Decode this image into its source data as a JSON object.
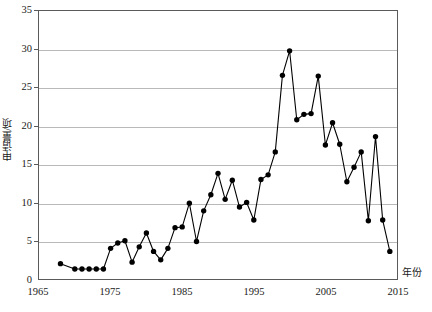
{
  "chart_data": {
    "type": "line",
    "title": "",
    "subtitle": "",
    "xlabel": "年份",
    "ylabel": "申请量/项",
    "xlim": [
      1965,
      2015
    ],
    "ylim": [
      0,
      35
    ],
    "grid": true,
    "legend": null,
    "marker": "filled-circle",
    "line_color": "#000000",
    "marker_color": "#000000",
    "grid_color": "#b9b9b9",
    "axis_color": "#5a5a5a",
    "xticks": [
      1965,
      1975,
      1985,
      1995,
      2005,
      2015
    ],
    "xtick_labels": [
      "1965",
      "1975",
      "1985",
      "1995",
      "2005",
      "2015"
    ],
    "yticks": [
      0,
      5,
      10,
      15,
      20,
      25,
      30,
      35
    ],
    "ytick_labels": [
      "0",
      "5",
      "10",
      "15",
      "20",
      "25",
      "30",
      "35"
    ],
    "series": [
      {
        "name": "申请量",
        "x": [
          1968,
          1970,
          1971,
          1972,
          1973,
          1974,
          1975,
          1976,
          1977,
          1978,
          1979,
          1980,
          1981,
          1982,
          1983,
          1984,
          1985,
          1986,
          1987,
          1988,
          1989,
          1990,
          1991,
          1992,
          1993,
          1994,
          1995,
          1996,
          1997,
          1998,
          1999,
          2000,
          2001,
          2002,
          2003,
          2004,
          2005,
          2006,
          2007,
          2008,
          2009,
          2010,
          2011,
          2012,
          2013,
          2014
        ],
        "values": [
          2.0,
          1.3,
          1.3,
          1.3,
          1.3,
          1.3,
          4.0,
          4.7,
          5.0,
          2.2,
          4.2,
          6.0,
          3.6,
          2.5,
          4.0,
          6.7,
          6.8,
          9.9,
          4.9,
          8.9,
          11.0,
          13.8,
          10.4,
          12.9,
          9.4,
          10.0,
          7.7,
          13.0,
          13.6,
          16.6,
          26.6,
          29.8,
          20.8,
          21.5,
          21.6,
          26.5,
          17.5,
          20.4,
          17.6,
          12.7,
          14.6,
          16.6,
          7.6,
          18.6,
          7.7,
          3.6
        ]
      }
    ]
  },
  "axes": {
    "y_title": "申请量/项",
    "x_title": "年份"
  }
}
